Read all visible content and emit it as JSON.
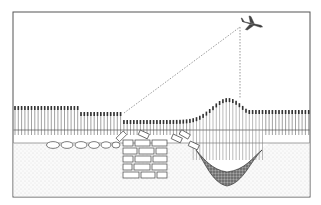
{
  "diagram": {
    "elements": [
      {
        "name": "airplane",
        "description": "Aircraft observing from above"
      },
      {
        "name": "sight-line-oblique",
        "description": "Dashed line of sight to crop-mark boundary over wall"
      },
      {
        "name": "sight-line-vertical",
        "description": "Dashed vertical line of sight to crop mark over ditch"
      },
      {
        "name": "crop-row",
        "description": "Standing crop of varying height"
      },
      {
        "name": "topsoil",
        "description": "Topsoil layer with roots"
      },
      {
        "name": "subsoil",
        "description": "Stippled subsoil"
      },
      {
        "name": "stone-row",
        "description": "Buried rounded stones"
      },
      {
        "name": "buried-wall",
        "description": "Buried masonry wall (stunted crop above)"
      },
      {
        "name": "filled-ditch",
        "description": "Filled ditch (taller crop above)"
      }
    ],
    "colors": {
      "ink": "#333333",
      "paper": "#ffffff",
      "stipple": "#d6d6d6",
      "ditch": "#666666"
    }
  }
}
